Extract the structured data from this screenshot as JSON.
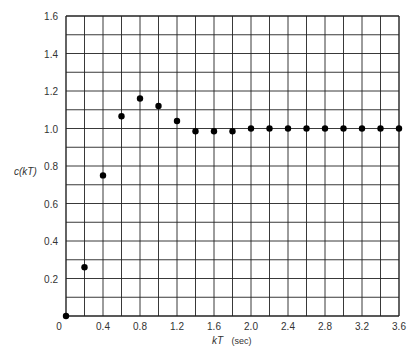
{
  "chart_data": {
    "type": "scatter",
    "title": "",
    "xlabel": "kT",
    "xlabel_unit": "(sec)",
    "ylabel": "c(kT)",
    "xlim": [
      0,
      3.6
    ],
    "ylim": [
      0,
      1.6
    ],
    "grid": true,
    "x_grid_step": 0.2,
    "y_grid_step": 0.1,
    "x_ticks": [
      "0",
      "0.4",
      "0.8",
      "1.2",
      "1.6",
      "2.0",
      "2.4",
      "2.8",
      "3.2",
      "3.6"
    ],
    "y_ticks": [
      "0.2",
      "0.4",
      "0.6",
      "0.8",
      "1.0",
      "1.2",
      "1.4",
      "1.6"
    ],
    "series": [
      {
        "name": "c(kT)",
        "x": [
          0,
          0.2,
          0.4,
          0.6,
          0.8,
          1.0,
          1.2,
          1.4,
          1.6,
          1.8,
          2.0,
          2.2,
          2.4,
          2.6,
          2.8,
          3.0,
          3.2,
          3.4,
          3.6
        ],
        "y": [
          0,
          0.26,
          0.75,
          1.065,
          1.16,
          1.12,
          1.04,
          0.985,
          0.985,
          0.985,
          1.0,
          1.0,
          1.0,
          1.0,
          1.0,
          1.0,
          1.0,
          1.0,
          1.0
        ]
      }
    ]
  }
}
